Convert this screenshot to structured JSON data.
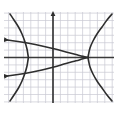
{
  "figure": {
    "background_color": "#ffffff",
    "width": 118,
    "height": 117
  },
  "chart_data": {
    "type": "line",
    "title": "",
    "subtitle": "",
    "xlabel": "",
    "ylabel": "",
    "grid": true,
    "grid_color": "#c8c8d2",
    "grid_spacing_px": 7.4,
    "axis_color": "#3a3a3a",
    "curve_color": "#2e2e2e",
    "legend": "none",
    "xlim": [
      -7,
      9
    ],
    "ylim": [
      -6.5,
      6.5
    ],
    "axes": {
      "x_axis_visible": true,
      "y_axis_visible": true,
      "y_axis_arrow": "up",
      "origin_px": {
        "x": 53,
        "y": 57.5
      }
    },
    "plot_area_px": {
      "left": 4,
      "top": 12,
      "right": 114,
      "bottom": 103
    },
    "annotations": [
      {
        "name": "arrowhead-upper-left-inner-curve",
        "x_px": 7,
        "y_px": 40
      },
      {
        "name": "arrowhead-lower-left-inner-curve",
        "x_px": 7,
        "y_px": 76
      },
      {
        "name": "arrowhead-y-axis-top",
        "x_px": 53,
        "y_px": 13
      }
    ],
    "series": [
      {
        "name": "left-opening-branch-upper",
        "kind": "hyperbola-branch",
        "stroke": "#2e2e2e",
        "stroke_width": 1.6,
        "points_px": [
          [
            10,
            14
          ],
          [
            14,
            20
          ],
          [
            18.5,
            27
          ],
          [
            22,
            34
          ],
          [
            25,
            42
          ],
          [
            27,
            49
          ],
          [
            28,
            55
          ],
          [
            28.4,
            57.5
          ]
        ]
      },
      {
        "name": "left-opening-branch-lower",
        "kind": "hyperbola-branch",
        "stroke": "#2e2e2e",
        "stroke_width": 1.6,
        "points_px": [
          [
            28.4,
            57.5
          ],
          [
            28,
            60
          ],
          [
            27,
            66
          ],
          [
            25,
            73
          ],
          [
            22,
            81
          ],
          [
            18.5,
            88
          ],
          [
            14,
            95
          ],
          [
            10,
            101
          ]
        ]
      },
      {
        "name": "right-opening-branch-upper",
        "kind": "hyperbola-branch",
        "stroke": "#2e2e2e",
        "stroke_width": 1.6,
        "points_px": [
          [
            88,
            57.5
          ],
          [
            88.6,
            54
          ],
          [
            90,
            48
          ],
          [
            93,
            41
          ],
          [
            97,
            34
          ],
          [
            102,
            27
          ],
          [
            107,
            20
          ],
          [
            112,
            14
          ]
        ]
      },
      {
        "name": "right-opening-branch-lower",
        "kind": "hyperbola-branch",
        "stroke": "#2e2e2e",
        "stroke_width": 1.6,
        "points_px": [
          [
            88,
            57.5
          ],
          [
            88.6,
            61
          ],
          [
            90,
            67
          ],
          [
            93,
            74
          ],
          [
            97,
            81
          ],
          [
            102,
            88
          ],
          [
            107,
            95
          ],
          [
            112,
            101
          ]
        ]
      },
      {
        "name": "inner-left-opening-parabola-upper",
        "kind": "parabola",
        "stroke": "#2e2e2e",
        "stroke_width": 1.6,
        "points_px": [
          [
            7,
            40
          ],
          [
            18,
            41.5
          ],
          [
            30,
            43.5
          ],
          [
            42,
            46
          ],
          [
            54,
            48.8
          ],
          [
            66,
            52
          ],
          [
            76,
            54.6
          ],
          [
            83,
            56.4
          ],
          [
            88,
            57.5
          ]
        ]
      },
      {
        "name": "inner-left-opening-parabola-lower",
        "kind": "parabola",
        "stroke": "#2e2e2e",
        "stroke_width": 1.6,
        "points_px": [
          [
            7,
            76
          ],
          [
            18,
            74.5
          ],
          [
            30,
            72.5
          ],
          [
            42,
            70
          ],
          [
            54,
            67
          ],
          [
            66,
            63.5
          ],
          [
            76,
            60.8
          ],
          [
            83,
            58.8
          ],
          [
            88,
            57.5
          ]
        ]
      }
    ]
  }
}
